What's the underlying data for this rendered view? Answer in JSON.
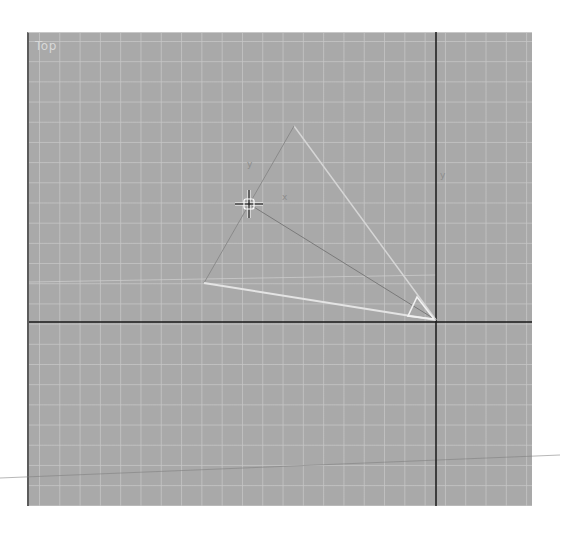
{
  "viewport": {
    "label": "Top",
    "background_color": "#a9a9a9",
    "grid_color": "#c8c8c8",
    "axis_color": "#1a1a1a"
  },
  "scene": {
    "axis": {
      "vertical_x": 436,
      "horizontal_y": 322
    },
    "camera_apex": [
      436,
      320
    ],
    "fov_vertices": [
      [
        294,
        126
      ],
      [
        204,
        283
      ]
    ],
    "target_position": [
      249,
      204
    ],
    "axis_labels": {
      "x": "x",
      "y": "y"
    }
  },
  "cursor": {
    "type": "move-crosshair",
    "position": [
      249,
      204
    ]
  }
}
